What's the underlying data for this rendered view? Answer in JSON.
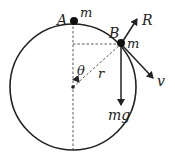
{
  "diagram": {
    "circle": {
      "cx": 73,
      "cy": 87,
      "r": 63,
      "stroke": "#222222"
    },
    "labels": {
      "A": "A",
      "m_top": "m",
      "B": "B",
      "m_B": "m",
      "R": "R",
      "v": "v",
      "mg": "mg",
      "theta": "θ",
      "r": "r"
    },
    "points": {
      "A": {
        "x": 73,
        "y": 22
      },
      "B": {
        "x": 121,
        "y": 44
      },
      "center": {
        "x": 73,
        "y": 87
      }
    },
    "vectors": [
      {
        "name": "R",
        "description": "normal reaction, radially outward"
      },
      {
        "name": "v",
        "description": "velocity, tangent to circle"
      },
      {
        "name": "mg",
        "description": "weight, vertically downward"
      }
    ]
  }
}
